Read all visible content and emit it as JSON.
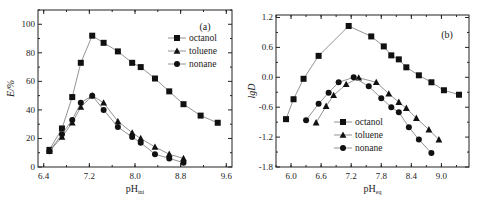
{
  "figure": {
    "panels": [
      "(a)",
      "(b)"
    ]
  },
  "chart_data": [
    {
      "type": "line",
      "panel_label": "(a)",
      "title": "",
      "xlabel": "pH",
      "xlabel_sub": "ini",
      "ylabel": "E/%",
      "xlim": [
        6.3,
        9.7
      ],
      "ylim": [
        0,
        110
      ],
      "xticks": [
        6.4,
        7.2,
        8.0,
        8.8,
        9.6
      ],
      "xtick_labels": [
        "6.4",
        "7.2",
        "8.0",
        "8.8",
        "9.6"
      ],
      "yticks": [
        0,
        20,
        40,
        60,
        80,
        100
      ],
      "ytick_labels": [
        "0",
        "20",
        "40",
        "60",
        "80",
        "100"
      ],
      "grid": false,
      "legend_position": "upper right",
      "series": [
        {
          "name": "octanol",
          "marker": "square",
          "x": [
            6.5,
            6.72,
            6.9,
            7.05,
            7.25,
            7.45,
            7.7,
            7.95,
            8.1,
            8.35,
            8.6,
            8.85,
            9.15,
            9.45
          ],
          "y": [
            12,
            27,
            49,
            73,
            92,
            87,
            81,
            73,
            70,
            62,
            53,
            44,
            36,
            31
          ]
        },
        {
          "name": "toluene",
          "marker": "triangle",
          "x": [
            6.5,
            6.72,
            6.9,
            7.05,
            7.25,
            7.45,
            7.7,
            7.95,
            8.1,
            8.35,
            8.6,
            8.85
          ],
          "y": [
            11,
            21,
            31,
            42,
            50,
            45,
            32,
            24,
            20,
            14,
            9,
            6
          ]
        },
        {
          "name": "nonane",
          "marker": "circle",
          "x": [
            6.5,
            6.72,
            6.9,
            7.05,
            7.25,
            7.45,
            7.7,
            7.95,
            8.1,
            8.35,
            8.6,
            8.85
          ],
          "y": [
            11,
            23,
            33,
            45,
            50,
            40,
            28,
            21,
            17,
            9,
            6,
            3
          ]
        }
      ]
    },
    {
      "type": "line",
      "panel_label": "(b)",
      "title": "",
      "xlabel": "pH",
      "xlabel_sub": "eq",
      "ylabel": "lgD",
      "xlim": [
        5.7,
        9.55
      ],
      "ylim": [
        -1.8,
        1.25
      ],
      "xticks": [
        6.0,
        6.6,
        7.2,
        7.8,
        8.4,
        9.0
      ],
      "xtick_labels": [
        "6.0",
        "6.6",
        "7.2",
        "7.8",
        "8.4",
        "9.0"
      ],
      "yticks": [
        -1.8,
        -1.2,
        -0.6,
        0.0,
        0.6,
        1.2
      ],
      "ytick_labels": [
        "-1.8",
        "-1.2",
        "-0.6",
        "0.0",
        "0.6",
        "1.2"
      ],
      "grid": false,
      "legend_position": "lower center",
      "series": [
        {
          "name": "octanol",
          "marker": "square",
          "x": [
            5.9,
            6.05,
            6.25,
            6.55,
            7.15,
            7.6,
            7.85,
            8.0,
            8.15,
            8.3,
            8.55,
            8.8,
            9.05,
            9.35
          ],
          "y": [
            -0.84,
            -0.44,
            -0.03,
            0.43,
            1.03,
            0.82,
            0.62,
            0.44,
            0.36,
            0.2,
            0.04,
            -0.1,
            -0.26,
            -0.35
          ]
        },
        {
          "name": "toluene",
          "marker": "triangle",
          "x": [
            6.5,
            6.7,
            6.85,
            7.1,
            7.35,
            7.7,
            7.95,
            8.15,
            8.3,
            8.5,
            8.75,
            8.95
          ],
          "y": [
            -0.91,
            -0.58,
            -0.36,
            -0.14,
            -0.01,
            -0.1,
            -0.33,
            -0.5,
            -0.62,
            -0.82,
            -1.05,
            -1.25
          ]
        },
        {
          "name": "nonane",
          "marker": "circle",
          "x": [
            6.3,
            6.55,
            6.75,
            6.95,
            7.25,
            7.55,
            7.8,
            8.0,
            8.15,
            8.35,
            8.55,
            8.8
          ],
          "y": [
            -0.86,
            -0.53,
            -0.31,
            -0.1,
            0.0,
            -0.18,
            -0.42,
            -0.6,
            -0.7,
            -1.0,
            -1.25,
            -1.52
          ]
        }
      ]
    }
  ]
}
